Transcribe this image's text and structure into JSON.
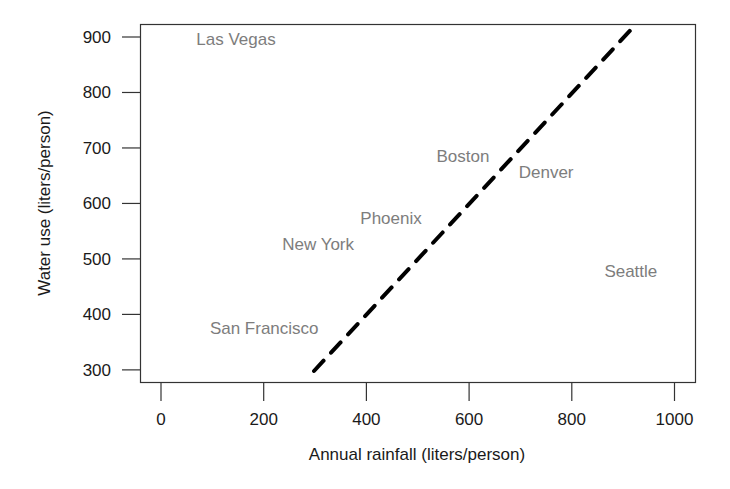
{
  "chart_data": {
    "type": "scatter",
    "title": "",
    "xlabel": "Annual rainfall (liters/person)",
    "ylabel": "Water use (liters/person)",
    "xlim": [
      -40,
      1040
    ],
    "ylim": [
      275,
      925
    ],
    "x_ticks": [
      0,
      200,
      400,
      600,
      800,
      1000
    ],
    "y_ticks": [
      300,
      400,
      500,
      600,
      700,
      800,
      900
    ],
    "grid": false,
    "legend": null,
    "points": [
      {
        "label": "Las Vegas",
        "x": 146,
        "y": 896
      },
      {
        "label": "Boston",
        "x": 588,
        "y": 686
      },
      {
        "label": "Denver",
        "x": 750,
        "y": 657
      },
      {
        "label": "Phoenix",
        "x": 448,
        "y": 574
      },
      {
        "label": "New York",
        "x": 306,
        "y": 527
      },
      {
        "label": "Seattle",
        "x": 915,
        "y": 479
      },
      {
        "label": "San Francisco",
        "x": 201,
        "y": 376
      }
    ],
    "reference_line": {
      "style": "dashed",
      "color": "#000000",
      "description": "y = x",
      "from": {
        "x": 298,
        "y": 298
      },
      "to": {
        "x": 925,
        "y": 923
      }
    },
    "colors": {
      "label_text": "#7d7d7d",
      "axes": "#333333",
      "line": "#000000"
    }
  }
}
